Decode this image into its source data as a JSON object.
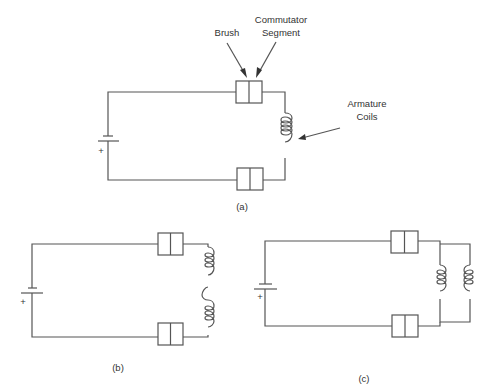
{
  "figure": {
    "panels": [
      {
        "id": "a",
        "caption": "(a)",
        "description": "Single armature coil between brushes"
      },
      {
        "id": "b",
        "caption": "(b)",
        "description": "Two armature coils in series"
      },
      {
        "id": "c",
        "caption": "(c)",
        "description": "Two armature coils in parallel"
      }
    ],
    "labels": {
      "brush": "Brush",
      "commutator_line1": "Commutator",
      "commutator_line2": "Segment",
      "armature_line1": "Armature",
      "armature_line2": "Coils",
      "plus": "+"
    },
    "colors": {
      "line": "#555555",
      "text": "#333333",
      "background": "#ffffff"
    }
  }
}
